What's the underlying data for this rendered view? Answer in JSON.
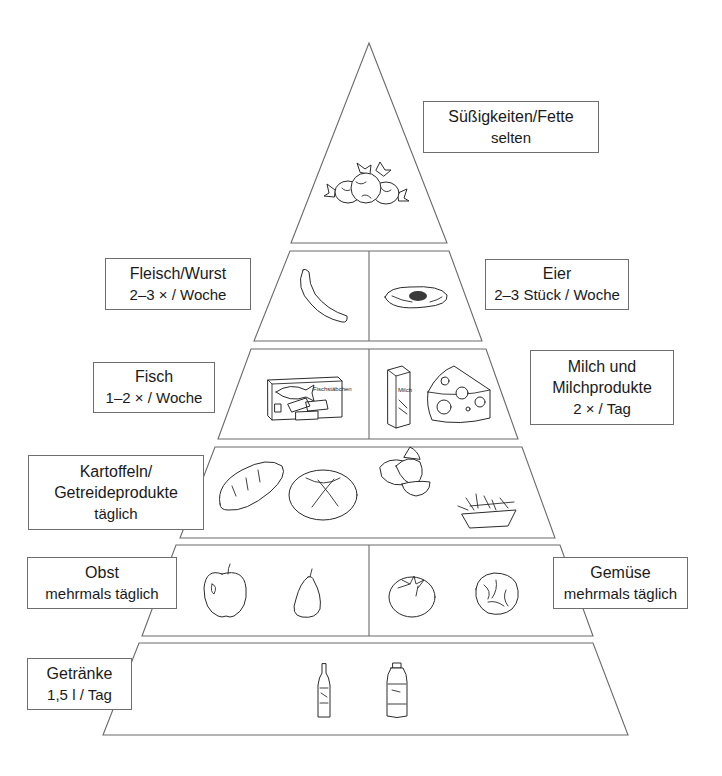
{
  "diagram": {
    "tiers": [
      {
        "id": "tier-1",
        "sections": [
          {
            "category": "Süßigkeiten/Fette",
            "frequency": "selten",
            "illustrations": [
              "candy-icon"
            ]
          }
        ]
      },
      {
        "id": "tier-2",
        "sections": [
          {
            "category": "Fleisch/Wurst",
            "frequency": "2–3 × / Woche",
            "illustrations": [
              "sausage-icon"
            ]
          },
          {
            "category": "Eier",
            "frequency": "2–3 Stück / Woche",
            "illustrations": [
              "fried-egg-icon"
            ]
          }
        ]
      },
      {
        "id": "tier-3",
        "sections": [
          {
            "category": "Fisch",
            "frequency": "1–2 × / Woche",
            "illustrations": [
              "fish-fingers-box-icon"
            ]
          },
          {
            "category": "Milch und Milchprodukte",
            "category_lines": [
              "Milch und",
              "Milchprodukte"
            ],
            "frequency": "2 × / Tag",
            "illustrations": [
              "milk-carton-icon",
              "cheese-icon"
            ]
          }
        ]
      },
      {
        "id": "tier-4",
        "sections": [
          {
            "category": "Kartoffeln/Getreideprodukte",
            "category_lines": [
              "Kartoffeln/",
              "Getreideprodukte"
            ],
            "frequency": "täglich",
            "illustrations": [
              "baguette-icon",
              "round-bread-icon",
              "potato-wedges-icon",
              "fries-tray-icon"
            ]
          }
        ]
      },
      {
        "id": "tier-5",
        "sections": [
          {
            "category": "Obst",
            "frequency": "mehrmals täglich",
            "illustrations": [
              "apple-icon",
              "pear-icon"
            ]
          },
          {
            "category": "Gemüse",
            "frequency": "mehrmals täglich",
            "illustrations": [
              "tomato-icon",
              "lettuce-icon"
            ]
          }
        ]
      },
      {
        "id": "tier-6",
        "sections": [
          {
            "category": "Getränke",
            "frequency": "1,5 l / Tag",
            "illustrations": [
              "juice-bottle-icon",
              "water-bottle-icon"
            ]
          }
        ]
      }
    ],
    "fish_box_text": "Fischstäbchen",
    "milk_carton_text": "Milch",
    "colors": {
      "line": "#6a6a6a",
      "text": "#1a1a1a",
      "background": "#ffffff"
    }
  }
}
